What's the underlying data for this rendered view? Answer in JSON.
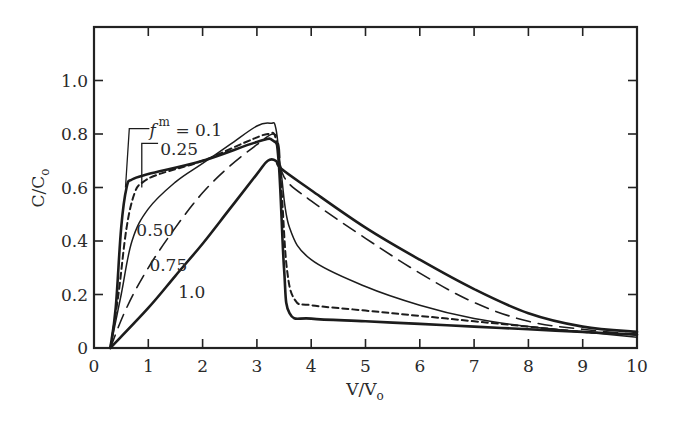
{
  "chart_data": {
    "type": "line",
    "title": "",
    "xlabel": "V/V",
    "xlabel_subscript": "o",
    "ylabel": "C/C",
    "ylabel_subscript": "o",
    "xlim": [
      0,
      10
    ],
    "ylim": [
      0,
      1.2
    ],
    "grid": false,
    "legend": "inline annotations",
    "x_ticks": [
      0,
      1,
      2,
      3,
      4,
      5,
      6,
      7,
      8,
      9,
      10
    ],
    "x_tick_labels": [
      "0",
      "1",
      "2",
      "3",
      "4",
      "5",
      "6",
      "7",
      "8",
      "9",
      "10"
    ],
    "y_ticks": [
      0,
      0.2,
      0.4,
      0.6,
      0.8,
      1.0
    ],
    "y_tick_labels": [
      "0",
      "0.2",
      "0.4",
      "0.6",
      "0.8",
      "1.0"
    ],
    "parameter_symbol": "f",
    "parameter_superscript": "m",
    "series": [
      {
        "name": "f^m = 0.1",
        "label": "= 0.1",
        "style": "solid-thick",
        "points": [
          [
            0.3,
            0
          ],
          [
            0.4,
            0.15
          ],
          [
            0.5,
            0.45
          ],
          [
            0.6,
            0.6
          ],
          [
            0.7,
            0.63
          ],
          [
            1.0,
            0.65
          ],
          [
            2.0,
            0.7
          ],
          [
            3.0,
            0.77
          ],
          [
            3.3,
            0.775
          ],
          [
            3.4,
            0.7
          ],
          [
            3.5,
            0.3
          ],
          [
            3.6,
            0.13
          ],
          [
            4.0,
            0.11
          ],
          [
            5.0,
            0.1
          ],
          [
            6.0,
            0.09
          ],
          [
            7.0,
            0.08
          ],
          [
            8.0,
            0.07
          ],
          [
            9.0,
            0.06
          ],
          [
            10.0,
            0.05
          ]
        ]
      },
      {
        "name": "f^m = 0.25",
        "label": "0.25",
        "style": "short-dash",
        "points": [
          [
            0.3,
            0
          ],
          [
            0.45,
            0.2
          ],
          [
            0.6,
            0.45
          ],
          [
            0.75,
            0.58
          ],
          [
            0.9,
            0.62
          ],
          [
            1.2,
            0.65
          ],
          [
            2.0,
            0.7
          ],
          [
            2.8,
            0.77
          ],
          [
            3.2,
            0.8
          ],
          [
            3.35,
            0.78
          ],
          [
            3.45,
            0.6
          ],
          [
            3.55,
            0.3
          ],
          [
            3.7,
            0.18
          ],
          [
            4.0,
            0.16
          ],
          [
            5.0,
            0.14
          ],
          [
            6.0,
            0.12
          ],
          [
            7.0,
            0.1
          ],
          [
            8.0,
            0.08
          ],
          [
            9.0,
            0.06
          ],
          [
            10.0,
            0.05
          ]
        ]
      },
      {
        "name": "f^m = 0.50",
        "label": "0.50",
        "style": "solid-thin",
        "points": [
          [
            0.3,
            0
          ],
          [
            0.5,
            0.2
          ],
          [
            0.7,
            0.4
          ],
          [
            1.0,
            0.52
          ],
          [
            1.5,
            0.62
          ],
          [
            2.0,
            0.69
          ],
          [
            2.5,
            0.76
          ],
          [
            3.0,
            0.83
          ],
          [
            3.25,
            0.84
          ],
          [
            3.35,
            0.82
          ],
          [
            3.45,
            0.65
          ],
          [
            3.6,
            0.45
          ],
          [
            4.0,
            0.33
          ],
          [
            5.0,
            0.23
          ],
          [
            6.0,
            0.16
          ],
          [
            7.0,
            0.11
          ],
          [
            8.0,
            0.08
          ],
          [
            9.0,
            0.06
          ],
          [
            10.0,
            0.04
          ]
        ]
      },
      {
        "name": "f^m = 0.75",
        "label": "0.75",
        "style": "long-dash",
        "points": [
          [
            0.3,
            0
          ],
          [
            0.6,
            0.15
          ],
          [
            1.0,
            0.3
          ],
          [
            1.5,
            0.45
          ],
          [
            2.0,
            0.58
          ],
          [
            2.5,
            0.68
          ],
          [
            3.0,
            0.76
          ],
          [
            3.3,
            0.8
          ],
          [
            3.4,
            0.76
          ],
          [
            3.5,
            0.64
          ],
          [
            4.0,
            0.55
          ],
          [
            5.0,
            0.41
          ],
          [
            6.0,
            0.28
          ],
          [
            7.0,
            0.17
          ],
          [
            8.0,
            0.1
          ],
          [
            9.0,
            0.07
          ],
          [
            10.0,
            0.05
          ]
        ]
      },
      {
        "name": "f^m = 1.0",
        "label": "1.0",
        "style": "solid-thick",
        "points": [
          [
            0.3,
            0
          ],
          [
            1.0,
            0.15
          ],
          [
            1.5,
            0.27
          ],
          [
            2.0,
            0.39
          ],
          [
            2.5,
            0.52
          ],
          [
            3.0,
            0.65
          ],
          [
            3.2,
            0.7
          ],
          [
            3.35,
            0.7
          ],
          [
            3.45,
            0.67
          ],
          [
            4.0,
            0.59
          ],
          [
            5.0,
            0.45
          ],
          [
            6.0,
            0.33
          ],
          [
            7.0,
            0.22
          ],
          [
            8.0,
            0.13
          ],
          [
            9.0,
            0.08
          ],
          [
            10.0,
            0.06
          ]
        ]
      }
    ],
    "annotations": [
      {
        "text": "= 0.1",
        "series": "f^m = 0.1",
        "x": 1.4,
        "y": 0.82
      },
      {
        "text": "0.25",
        "series": "f^m = 0.25",
        "x": 1.5,
        "y": 0.76
      },
      {
        "text": "0.50",
        "series": "f^m = 0.50",
        "x": 0.8,
        "y": 0.45
      },
      {
        "text": "0.75",
        "series": "f^m = 0.75",
        "x": 1.1,
        "y": 0.34
      },
      {
        "text": "1.0",
        "series": "f^m = 1.0",
        "x": 1.55,
        "y": 0.2
      }
    ]
  },
  "colors": {
    "ink": "#1c1c1c",
    "axis": "#222222",
    "background": "#ffffff"
  }
}
